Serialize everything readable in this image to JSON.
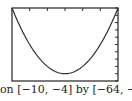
{
  "chart_data": {
    "type": "line",
    "title": "",
    "caption": "on [−10, −4] by [−64, −54]",
    "xlabel": "",
    "ylabel": "",
    "xlim": [
      -10,
      -4
    ],
    "ylim": [
      -64,
      -54
    ],
    "x_tick_step": 1,
    "y_tick_step": 1,
    "grid": false,
    "series": [
      {
        "name": "parabola",
        "function": "y = (x + 7)^2 - 63",
        "x": [
          -10,
          -9,
          -8,
          -7,
          -6,
          -5,
          -4
        ],
        "y": [
          -54,
          -59,
          -62,
          -63,
          -62,
          -59,
          -54
        ]
      }
    ]
  }
}
